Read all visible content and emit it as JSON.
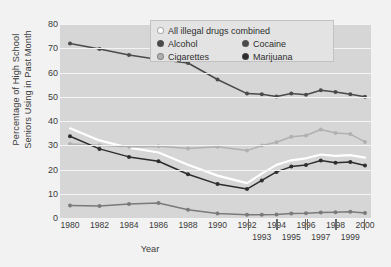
{
  "chart_data": {
    "type": "line",
    "title": "",
    "xlabel": "Year",
    "ylabel": "Percentage of High School Seniors Using in Past Month",
    "ylabel_lines": [
      "Percentage of High School",
      "Seniors Using in Past Month"
    ],
    "ylim": [
      0,
      80
    ],
    "ytick_labels": [
      "0",
      "10",
      "20",
      "30",
      "40",
      "50",
      "60",
      "70",
      "80"
    ],
    "ytick_values": [
      0,
      10,
      20,
      30,
      40,
      50,
      60,
      70,
      80
    ],
    "grid": "horizontal white gridlines",
    "legend_position": "top-center inside plot",
    "x": [
      1980,
      1982,
      1984,
      1986,
      1988,
      1990,
      1992,
      1993,
      1994,
      1995,
      1996,
      1997,
      1998,
      1999,
      2000
    ],
    "xtick_labels_top": [
      "1980",
      "1982",
      "1984",
      "1986",
      "1988",
      "1990",
      "1992",
      "1994",
      "1996",
      "1998",
      "2000"
    ],
    "xtick_labels_bottom": [
      "1993",
      "1995",
      "1997",
      "1999"
    ],
    "series": [
      {
        "name": "All illegal drugs combined",
        "color": "#ffffff",
        "values": [
          37.0,
          32.0,
          29.0,
          27.0,
          22.0,
          17.5,
          14.4,
          18.3,
          21.9,
          23.8,
          24.6,
          26.2,
          25.6,
          25.9,
          24.9
        ]
      },
      {
        "name": "Alcohol",
        "color": "#4a4a4a",
        "values": [
          72.0,
          69.7,
          67.2,
          65.3,
          63.9,
          57.1,
          51.3,
          51.0,
          50.1,
          51.3,
          50.8,
          52.7,
          52.0,
          51.0,
          50.0
        ]
      },
      {
        "name": "Cocaine",
        "color": "#7a7a7a",
        "values": [
          5.2,
          5.0,
          5.8,
          6.2,
          3.4,
          1.9,
          1.3,
          1.3,
          1.5,
          1.8,
          2.0,
          2.3,
          2.4,
          2.6,
          2.1
        ]
      },
      {
        "name": "Cigarettes",
        "color": "#b0b0b0",
        "values": [
          30.5,
          30.0,
          29.3,
          29.6,
          28.7,
          29.4,
          27.8,
          29.9,
          31.2,
          33.5,
          34.0,
          36.5,
          35.1,
          34.6,
          31.4
        ]
      },
      {
        "name": "Marijuana",
        "color": "#2d2d2d",
        "values": [
          33.7,
          28.5,
          25.2,
          23.4,
          18.0,
          14.0,
          11.9,
          15.5,
          19.0,
          21.2,
          21.9,
          23.7,
          22.8,
          23.1,
          21.6
        ]
      }
    ]
  },
  "legend": {
    "rows": [
      [
        {
          "label": "All illegal drugs combined",
          "color": "#ffffff",
          "width": "wide"
        }
      ],
      [
        {
          "label": "Alcohol",
          "color": "#4a4a4a",
          "width": "half"
        },
        {
          "label": "Cocaine",
          "color": "#4a4a4a",
          "width": "half"
        }
      ],
      [
        {
          "label": "Cigarettes",
          "color": "#b0b0b0",
          "width": "half"
        },
        {
          "label": "Marijuana",
          "color": "#2d2d2d",
          "width": "half"
        }
      ]
    ]
  },
  "colors": {
    "page_background": "#f2f2f2",
    "plot_background": "#d6d6d6",
    "gridline": "#f4f4f4",
    "text": "#3b3b3b",
    "legend_background": "#e3e3e3",
    "legend_border": "#c2c2c2"
  }
}
